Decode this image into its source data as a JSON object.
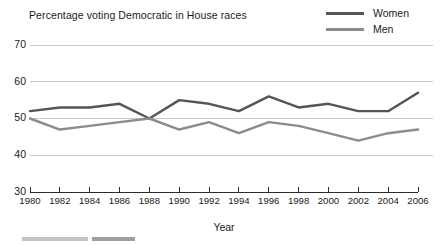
{
  "chart_data": {
    "type": "line",
    "title": "Percentage voting Democratic in House races",
    "xlabel": "Year",
    "ylabel": "",
    "x": [
      1980,
      1982,
      1984,
      1986,
      1988,
      1990,
      1992,
      1994,
      1996,
      1998,
      2000,
      2002,
      2004,
      2006
    ],
    "xlim": [
      1980,
      2006
    ],
    "ylim": [
      30,
      70
    ],
    "yticks": [
      30,
      40,
      50,
      60,
      70
    ],
    "xticks": [
      1980,
      1982,
      1984,
      1986,
      1988,
      1990,
      1992,
      1994,
      1996,
      1998,
      2000,
      2002,
      2004,
      2006
    ],
    "grid": true,
    "legend_position": "top-right",
    "series": [
      {
        "name": "Women",
        "color": "#555555",
        "values": [
          52,
          53,
          53,
          54,
          50,
          55,
          54,
          52,
          56,
          53,
          54,
          52,
          52,
          57
        ]
      },
      {
        "name": "Men",
        "color": "#8c8c8c",
        "values": [
          50,
          47,
          48,
          49,
          50,
          47,
          49,
          46,
          49,
          48,
          46,
          44,
          46,
          47
        ]
      }
    ]
  },
  "legend": {
    "items": [
      {
        "label": "Women"
      },
      {
        "label": "Men"
      }
    ]
  },
  "axes": {
    "x_title": "Year",
    "y_tick_labels": [
      "70",
      "60",
      "50",
      "40",
      "30"
    ],
    "x_tick_labels": [
      "1980",
      "1982",
      "1984",
      "1986",
      "1988",
      "1990",
      "1992",
      "1994",
      "1996",
      "1998",
      "2000",
      "2002",
      "2004",
      "2006"
    ]
  }
}
